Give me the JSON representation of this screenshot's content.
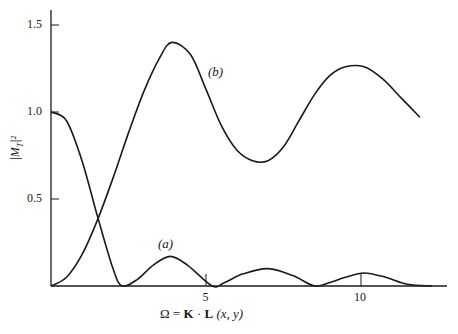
{
  "chart_data": {
    "type": "line",
    "title": "",
    "xlabel": "Ω = K · L (x, y)",
    "ylabel": "|M_T|²",
    "xlim": [
      0,
      12.5
    ],
    "ylim": [
      0,
      1.6
    ],
    "x_ticks": [
      5,
      10
    ],
    "y_ticks": [
      0.5,
      1.0,
      1.5
    ],
    "x_tick_labels": [
      "5",
      "10"
    ],
    "y_tick_labels": [
      "0.5",
      "1.0",
      "1.5"
    ],
    "grid": false,
    "legend": "inline labels",
    "series": [
      {
        "name": "(a)",
        "x": [
          0,
          0.5,
          1.0,
          1.5,
          2.0,
          2.3,
          2.8,
          3.3,
          3.85,
          4.4,
          5.2,
          5.6,
          6.2,
          7.0,
          7.8,
          8.5,
          9.0,
          9.5,
          10.1,
          10.8,
          11.5,
          12.3
        ],
        "y": [
          1.0,
          0.95,
          0.72,
          0.4,
          0.1,
          0.0,
          0.04,
          0.12,
          0.17,
          0.12,
          0.0,
          0.02,
          0.07,
          0.1,
          0.06,
          0.0,
          0.02,
          0.05,
          0.075,
          0.05,
          0.01,
          0.0
        ]
      },
      {
        "name": "(b)",
        "x": [
          0,
          0.5,
          1.0,
          1.5,
          2.0,
          2.5,
          3.0,
          3.5,
          3.9,
          4.5,
          5.0,
          5.5,
          6.0,
          6.5,
          7.0,
          7.5,
          8.0,
          8.5,
          9.0,
          9.5,
          10.1,
          10.7,
          11.3,
          11.9
        ],
        "y": [
          0.0,
          0.05,
          0.18,
          0.38,
          0.62,
          0.88,
          1.12,
          1.31,
          1.4,
          1.33,
          1.13,
          0.92,
          0.78,
          0.72,
          0.72,
          0.8,
          0.95,
          1.1,
          1.21,
          1.26,
          1.26,
          1.19,
          1.08,
          0.97
        ]
      }
    ],
    "annotations": [
      "(a)",
      "(b)"
    ]
  },
  "labels": {
    "xlabel_omega": "Ω = ",
    "xlabel_K": "K",
    "xlabel_dot": " · ",
    "xlabel_L": "L",
    "xlabel_args": " (x, y)",
    "ylabel": "|M",
    "ylabel_sub": "T",
    "ylabel_sup": "|²",
    "series_a": "(a)",
    "series_b": "(b)"
  }
}
